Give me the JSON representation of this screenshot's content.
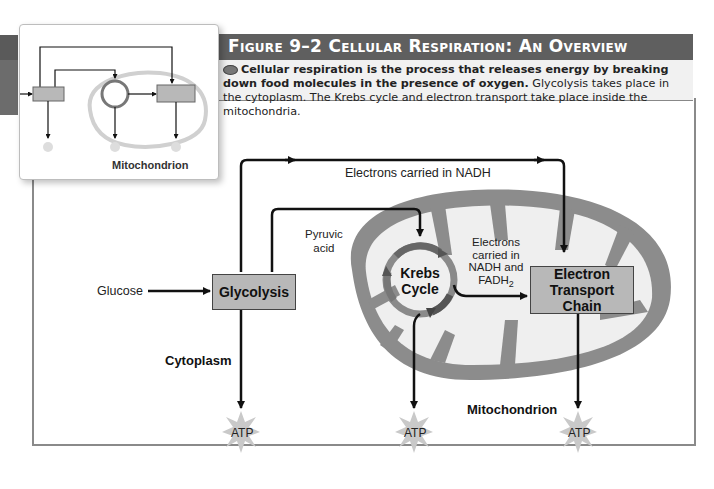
{
  "figure": {
    "title": "Figure 9–2  Cellular Respiration: An Overview",
    "caption_bold": "Cellular respiration is the process that releases energy by breaking down food molecules in the presence of oxygen.",
    "caption_rest": " Glycolysis takes place in the cytoplasm. The Krebs cycle and electron transport take place inside the mitochondria.",
    "header_color": "#5f5f5f"
  },
  "thumbnail": {
    "label": "Mitochondrion"
  },
  "diagram": {
    "input_label": "Glucose",
    "glycolysis_label": "Glycolysis",
    "pyruvic_label_line1": "Pyruvic",
    "pyruvic_label_line2": "acid",
    "nadh_label": "Electrons carried in NADH",
    "krebs_line1": "Krebs",
    "krebs_line2": "Cycle",
    "electrons_fadh_line1": "Electrons",
    "electrons_fadh_line2": "carried in",
    "electrons_fadh_line3": "NADH and",
    "electrons_fadh_line4": "FADH",
    "electrons_fadh_sub": "2",
    "etc_line1": "Electron",
    "etc_line2": "Transport Chain",
    "cytoplasm_label": "Cytoplasm",
    "mitochondrion_label": "Mitochondrion",
    "atp_outputs": [
      "ATP",
      "ATP",
      "ATP"
    ]
  }
}
